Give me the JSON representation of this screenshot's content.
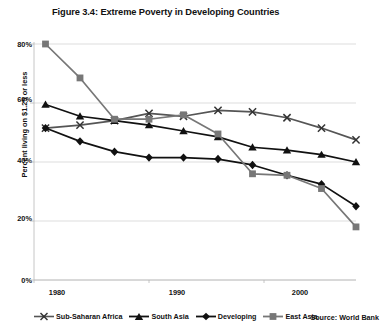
{
  "figure": {
    "title": "Figure 3.4: Extreme Poverty in Developing Countries",
    "source": "Source: World Bank"
  },
  "chart_data": {
    "type": "line",
    "title": "Figure 3.4: Extreme Poverty in Developing Countries",
    "xlabel": "",
    "ylabel": "Percent living on $1.25 or less",
    "xlim": [
      1980,
      2008
    ],
    "ylim": [
      0,
      80
    ],
    "grid": true,
    "legend_position": "bottom",
    "xticks": [
      1980,
      1990,
      2000
    ],
    "xticklabels": [
      "1980",
      "1990",
      "2000"
    ],
    "yticks": [
      0,
      20,
      40,
      60,
      80
    ],
    "yticklabels": [
      "0%",
      "20%",
      "40%",
      "60%",
      "80%"
    ],
    "x": [
      1981,
      1984,
      1987,
      1990,
      1993,
      1996,
      1999,
      2002,
      2005,
      2008
    ],
    "series": [
      {
        "name": "Sub-Saharan Africa",
        "marker": "x",
        "color": "#555555",
        "values": [
          51.5,
          52.5,
          54.0,
          56.5,
          55.5,
          57.5,
          57.0,
          55.0,
          51.5,
          47.5
        ]
      },
      {
        "name": "South Asia",
        "marker": "triangle",
        "color": "#111111",
        "values": [
          59.5,
          55.5,
          54.0,
          52.5,
          50.5,
          48.5,
          45.0,
          44.0,
          42.5,
          40.0
        ]
      },
      {
        "name": "Developing",
        "marker": "diamond",
        "color": "#111111",
        "values": [
          51.5,
          47.0,
          43.5,
          41.5,
          41.5,
          41.0,
          39.0,
          35.5,
          32.5,
          25.0
        ]
      },
      {
        "name": "East Asia",
        "marker": "square",
        "color": "#777777",
        "values": [
          80.0,
          68.5,
          54.5,
          54.5,
          56.0,
          49.5,
          36.0,
          35.5,
          31.0,
          18.0
        ]
      }
    ]
  },
  "legend": [
    {
      "label": "Sub-Saharan Africa",
      "marker": "x-marker-icon",
      "color": "#555555"
    },
    {
      "label": "South Asia",
      "marker": "triangle-marker-icon",
      "color": "#111111"
    },
    {
      "label": "Developing",
      "marker": "diamond-marker-icon",
      "color": "#111111"
    },
    {
      "label": "East Asia",
      "marker": "square-marker-icon",
      "color": "#777777"
    }
  ]
}
